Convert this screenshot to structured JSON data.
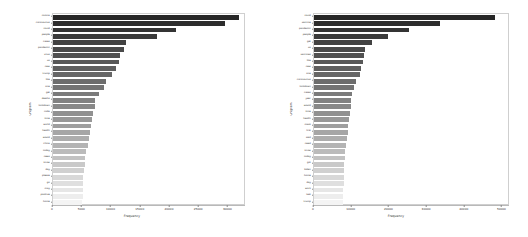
{
  "figure": {
    "type": "multi-panel-bar-chart",
    "panel_count": 2,
    "background_color": "#ffffff",
    "axis_color": "#cfcfcf"
  },
  "chart_data": [
    {
      "type": "bar",
      "orientation": "horizontal",
      "panel": "left",
      "title": "",
      "xlabel": "Frequency",
      "ylabel": "unigram",
      "xlim": [
        0,
        33000
      ],
      "ylim": [
        0,
        30
      ],
      "grid": false,
      "legend": "none",
      "xticks": [
        0,
        5000,
        10000,
        15000,
        20000,
        25000,
        30000
      ],
      "xticklabels": [
        "0",
        "5000",
        "10000",
        "15000",
        "20000",
        "25000",
        "30000"
      ],
      "categories": [
        "corona",
        "coronavirus",
        "covid",
        "people",
        "cases",
        "pandemic",
        "virus",
        "us",
        "new",
        "trump",
        "like",
        "one",
        "get",
        "deaths",
        "lockdown",
        "india",
        "time",
        "world",
        "health",
        "would",
        "china",
        "today",
        "news",
        "know",
        "day",
        "please",
        "go",
        "may",
        "positive",
        "home"
      ],
      "values": [
        31800,
        29400,
        21100,
        17800,
        12500,
        12200,
        11500,
        11300,
        10700,
        10100,
        9100,
        8800,
        7900,
        7200,
        7100,
        6900,
        6700,
        6500,
        6300,
        6100,
        5900,
        5700,
        5500,
        5400,
        5300,
        5200,
        5150,
        5100,
        5050,
        5000
      ],
      "colormap": "grey-sequential-dark-to-light"
    },
    {
      "type": "bar",
      "orientation": "horizontal",
      "panel": "right",
      "title": "",
      "xlabel": "Frequency",
      "ylabel": "unigram",
      "xlim": [
        0,
        52000
      ],
      "ylim": [
        0,
        30
      ],
      "grid": false,
      "legend": "none",
      "xticks": [
        0,
        10000,
        20000,
        30000,
        40000,
        50000
      ],
      "xticklabels": [
        "0",
        "10000",
        "20000",
        "30000",
        "40000",
        "50000"
      ],
      "categories": [
        "covid",
        "vaccine",
        "pandemic",
        "people",
        "get",
        "us",
        "vaccines",
        "like",
        "new",
        "one",
        "coronavirus",
        "lockdown",
        "cases",
        "year",
        "would",
        "time",
        "health",
        "mask",
        "first",
        "said",
        "need",
        "know",
        "today",
        "got",
        "biden",
        "home",
        "day",
        "work",
        "test",
        "trump"
      ],
      "values": [
        47900,
        33500,
        25100,
        19600,
        15500,
        13400,
        13200,
        12900,
        12600,
        12300,
        11100,
        10700,
        10200,
        9900,
        9700,
        9500,
        9300,
        9100,
        8900,
        8700,
        8500,
        8300,
        8150,
        8050,
        7950,
        7900,
        7850,
        7800,
        7750,
        7700
      ],
      "colormap": "grey-sequential-dark-to-light"
    }
  ]
}
